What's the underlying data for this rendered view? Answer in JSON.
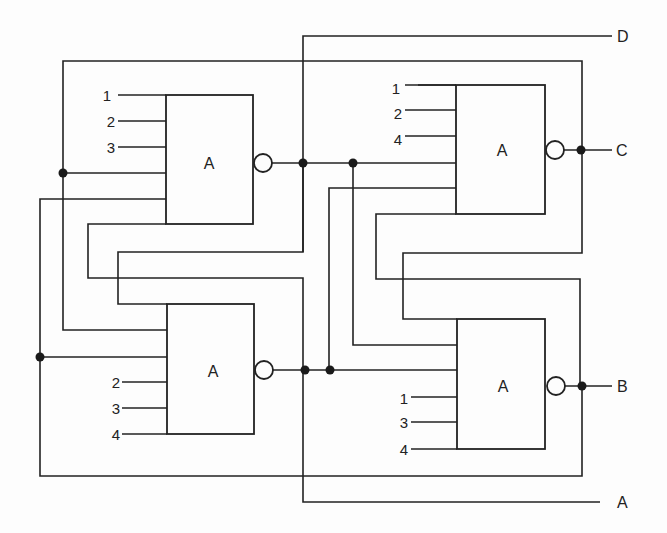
{
  "diagram": {
    "type": "logic-circuit",
    "gates": [
      {
        "id": "gate-top-left",
        "label": "A",
        "inputs": [
          "1",
          "2",
          "3"
        ],
        "inverted_output": true
      },
      {
        "id": "gate-top-right",
        "label": "A",
        "inputs": [
          "1",
          "2",
          "4"
        ],
        "inverted_output": true,
        "output": "C"
      },
      {
        "id": "gate-bottom-left",
        "label": "A",
        "inputs": [
          "2",
          "3",
          "4"
        ],
        "inverted_output": true
      },
      {
        "id": "gate-bottom-right",
        "label": "A",
        "inputs": [
          "1",
          "3",
          "4"
        ],
        "inverted_output": true,
        "output": "B"
      }
    ],
    "outputs": {
      "d": "D",
      "c": "C",
      "b": "B",
      "a": "A"
    }
  }
}
